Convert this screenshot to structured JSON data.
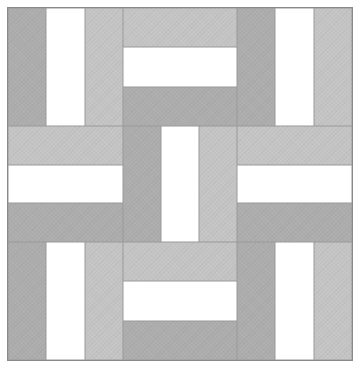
{
  "diagram": {
    "type": "rail-fence-quilt-block",
    "grid": {
      "rows": 3,
      "cols": 3
    },
    "colors": {
      "dark": "#adadad",
      "light": "#c4c4c4",
      "white": "#ffffff",
      "outline": "#8a8a8a",
      "background": "#ffffff"
    },
    "blocks": [
      {
        "row": 0,
        "col": 0,
        "orientation": "vertical",
        "strips": [
          "dark",
          "white",
          "light"
        ]
      },
      {
        "row": 0,
        "col": 1,
        "orientation": "horizontal",
        "strips": [
          "light",
          "white",
          "dark"
        ]
      },
      {
        "row": 0,
        "col": 2,
        "orientation": "vertical",
        "strips": [
          "dark",
          "white",
          "light"
        ]
      },
      {
        "row": 1,
        "col": 0,
        "orientation": "horizontal",
        "strips": [
          "light",
          "white",
          "dark"
        ]
      },
      {
        "row": 1,
        "col": 1,
        "orientation": "vertical",
        "strips": [
          "dark",
          "white",
          "light"
        ]
      },
      {
        "row": 1,
        "col": 2,
        "orientation": "horizontal",
        "strips": [
          "light",
          "white",
          "dark"
        ]
      },
      {
        "row": 2,
        "col": 0,
        "orientation": "vertical",
        "strips": [
          "dark",
          "white",
          "light"
        ]
      },
      {
        "row": 2,
        "col": 1,
        "orientation": "horizontal",
        "strips": [
          "light",
          "white",
          "dark"
        ]
      },
      {
        "row": 2,
        "col": 2,
        "orientation": "vertical",
        "strips": [
          "dark",
          "white",
          "light"
        ]
      }
    ]
  }
}
